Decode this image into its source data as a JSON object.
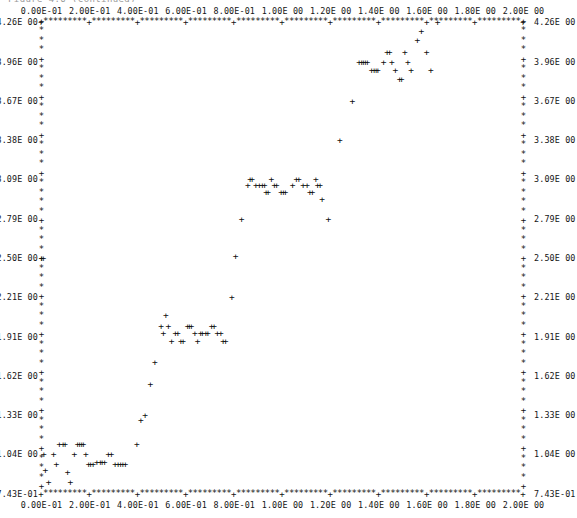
{
  "caption": {
    "text": "Figure 4.6   (continued)"
  },
  "chart_data": {
    "type": "scatter",
    "title": "",
    "xlabel": "",
    "ylabel": "",
    "marker": "+",
    "frame_marker": "*",
    "tick_marker": "+",
    "grid": false,
    "legend": null,
    "xlim": [
      0.0,
      2.0
    ],
    "ylim": [
      0.743,
      4.26
    ],
    "x_tick_labels": [
      "0.00E-01",
      "2.00E-01",
      "4.00E-01",
      "6.00E-01",
      "8.00E-01",
      "1.00E 00",
      "1.20E 00",
      "1.40E 00",
      "1.60E 00",
      "1.80E 00",
      "2.00E 00"
    ],
    "x_tick_values": [
      0.0,
      0.2,
      0.4,
      0.6,
      0.8,
      1.0,
      1.2,
      1.4,
      1.6,
      1.8,
      2.0
    ],
    "y_tick_labels": [
      "4.26E 00",
      "3.96E 00",
      "3.67E 00",
      "3.38E 00",
      "3.09E 00",
      "2.79E 00",
      "2.50E 00",
      "2.21E 00",
      "1.91E 00",
      "1.62E 00",
      "1.33E 00",
      "1.04E 00",
      "7.43E-01"
    ],
    "y_tick_values": [
      4.26,
      3.96,
      3.67,
      3.38,
      3.09,
      2.79,
      2.5,
      2.21,
      1.91,
      1.62,
      1.33,
      1.04,
      0.743
    ],
    "x_axis_top": true,
    "x_axis_bottom": true,
    "y_axis_left": true,
    "y_axis_right": true,
    "points": [
      [
        0.0,
        2.5
      ],
      [
        0.008,
        2.5
      ],
      [
        0.01,
        1.04
      ],
      [
        0.016,
        0.92
      ],
      [
        0.03,
        0.83
      ],
      [
        0.05,
        1.04
      ],
      [
        0.062,
        0.96
      ],
      [
        0.074,
        1.11
      ],
      [
        0.09,
        1.11
      ],
      [
        0.098,
        1.11
      ],
      [
        0.108,
        0.9
      ],
      [
        0.12,
        0.83
      ],
      [
        0.136,
        1.04
      ],
      [
        0.15,
        1.11
      ],
      [
        0.158,
        1.11
      ],
      [
        0.166,
        1.11
      ],
      [
        0.174,
        1.11
      ],
      [
        0.184,
        1.04
      ],
      [
        0.196,
        0.96
      ],
      [
        0.204,
        0.96
      ],
      [
        0.214,
        0.96
      ],
      [
        0.23,
        0.975
      ],
      [
        0.244,
        0.975
      ],
      [
        0.252,
        0.975
      ],
      [
        0.262,
        0.975
      ],
      [
        0.278,
        1.04
      ],
      [
        0.29,
        1.04
      ],
      [
        0.306,
        0.96
      ],
      [
        0.318,
        0.96
      ],
      [
        0.328,
        0.96
      ],
      [
        0.338,
        0.96
      ],
      [
        0.348,
        0.96
      ],
      [
        0.396,
        1.11
      ],
      [
        0.412,
        1.29
      ],
      [
        0.43,
        1.33
      ],
      [
        0.452,
        1.56
      ],
      [
        0.47,
        1.72
      ],
      [
        0.496,
        1.99
      ],
      [
        0.506,
        1.94
      ],
      [
        0.516,
        2.07
      ],
      [
        0.526,
        1.99
      ],
      [
        0.54,
        1.88
      ],
      [
        0.556,
        1.94
      ],
      [
        0.566,
        1.94
      ],
      [
        0.578,
        1.88
      ],
      [
        0.588,
        1.88
      ],
      [
        0.606,
        1.99
      ],
      [
        0.614,
        1.99
      ],
      [
        0.622,
        1.99
      ],
      [
        0.636,
        1.94
      ],
      [
        0.648,
        1.88
      ],
      [
        0.66,
        1.94
      ],
      [
        0.668,
        1.94
      ],
      [
        0.682,
        1.94
      ],
      [
        0.69,
        1.94
      ],
      [
        0.706,
        1.99
      ],
      [
        0.716,
        1.99
      ],
      [
        0.73,
        1.94
      ],
      [
        0.744,
        1.94
      ],
      [
        0.754,
        1.88
      ],
      [
        0.764,
        1.88
      ],
      [
        0.79,
        2.21
      ],
      [
        0.806,
        2.51
      ],
      [
        0.83,
        2.79
      ],
      [
        0.856,
        3.04
      ],
      [
        0.866,
        3.09
      ],
      [
        0.874,
        3.09
      ],
      [
        0.89,
        3.04
      ],
      [
        0.904,
        3.04
      ],
      [
        0.916,
        3.04
      ],
      [
        0.926,
        3.04
      ],
      [
        0.932,
        2.99
      ],
      [
        0.94,
        2.99
      ],
      [
        0.954,
        3.09
      ],
      [
        0.966,
        3.04
      ],
      [
        0.976,
        3.04
      ],
      [
        0.994,
        2.99
      ],
      [
        1.004,
        2.99
      ],
      [
        1.012,
        2.99
      ],
      [
        1.042,
        3.04
      ],
      [
        1.058,
        3.09
      ],
      [
        1.068,
        3.09
      ],
      [
        1.086,
        3.04
      ],
      [
        1.102,
        3.04
      ],
      [
        1.114,
        2.99
      ],
      [
        1.124,
        2.99
      ],
      [
        1.138,
        3.09
      ],
      [
        1.146,
        3.04
      ],
      [
        1.156,
        3.04
      ],
      [
        1.164,
        2.94
      ],
      [
        1.19,
        2.79
      ],
      [
        1.238,
        3.38
      ],
      [
        1.29,
        3.67
      ],
      [
        1.318,
        3.96
      ],
      [
        1.328,
        3.96
      ],
      [
        1.336,
        3.96
      ],
      [
        1.344,
        3.96
      ],
      [
        1.352,
        3.96
      ],
      [
        1.37,
        3.9
      ],
      [
        1.38,
        3.9
      ],
      [
        1.388,
        3.9
      ],
      [
        1.396,
        3.9
      ],
      [
        1.42,
        3.96
      ],
      [
        1.434,
        4.03
      ],
      [
        1.444,
        4.03
      ],
      [
        1.454,
        3.96
      ],
      [
        1.468,
        3.9
      ],
      [
        1.486,
        3.83
      ],
      [
        1.494,
        3.83
      ],
      [
        1.508,
        4.03
      ],
      [
        1.52,
        3.96
      ],
      [
        1.534,
        3.9
      ],
      [
        1.56,
        4.12
      ],
      [
        1.576,
        4.19
      ],
      [
        1.598,
        4.03
      ],
      [
        1.616,
        3.9
      ],
      [
        1.644,
        4.26
      ]
    ]
  }
}
